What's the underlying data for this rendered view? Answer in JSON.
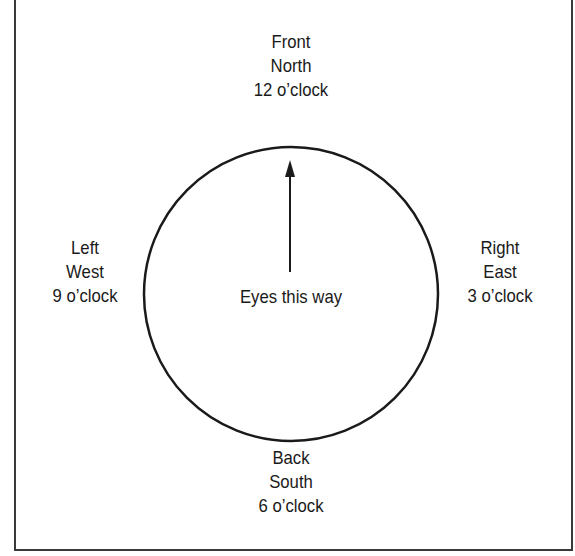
{
  "diagram": {
    "front": {
      "line1": "Front",
      "line2": "North",
      "line3": "12 o’clock"
    },
    "left": {
      "line1": "Left",
      "line2": "West",
      "line3": "9 o’clock"
    },
    "right": {
      "line1": "Right",
      "line2": "East",
      "line3": "3 o’clock"
    },
    "back": {
      "line1": "Back",
      "line2": "South",
      "line3": "6 o’clock"
    },
    "center": {
      "label": "Eyes this way",
      "arrow": "up-arrow"
    },
    "colors": {
      "stroke": "#1a1a1a",
      "background": "#ffffff",
      "frame": "#3a3a3a"
    }
  }
}
